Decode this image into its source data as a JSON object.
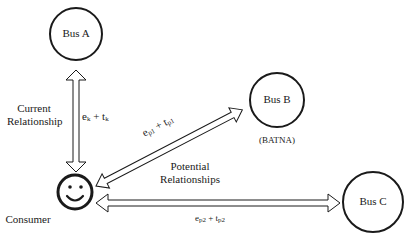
{
  "nodes": {
    "bus_a": {
      "label": "Bus A"
    },
    "bus_b": {
      "label": "Bus B",
      "note": "(BATNA)"
    },
    "bus_c": {
      "label": "Bus C"
    },
    "consumer": {
      "label": "Consumer",
      "icon": "smiley-face-icon"
    }
  },
  "edges": {
    "current": {
      "title_line1": "Current",
      "title_line2": "Relationship",
      "formula": {
        "e": "e",
        "e_sub": "k",
        "plus": " + ",
        "t": "t",
        "t_sub": "k"
      }
    },
    "potential_b": {
      "formula": {
        "e": "e",
        "e_sub": "p1",
        "plus": " + ",
        "t": "t",
        "t_sub": "p1"
      }
    },
    "potential_c": {
      "formula": {
        "e": "e",
        "e_sub": "p2",
        "plus": " + ",
        "t": "t",
        "t_sub": "p2"
      }
    },
    "potential_group": {
      "title_line1": "Potential",
      "title_line2": "Relationships"
    }
  },
  "colors": {
    "stroke": "#1a1a1a",
    "background": "#ffffff"
  }
}
